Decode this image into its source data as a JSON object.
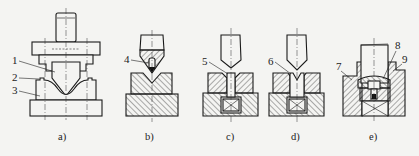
{
  "figure": {
    "line_color": "#1a1a1a",
    "background_color": "#f4f4f2"
  },
  "panels": [
    {
      "id": "a",
      "caption": "a)",
      "description": "Closed bending die set: punch with shank, upper plate, V-die on base plate",
      "callouts": [
        {
          "number": "1",
          "part": "punch"
        },
        {
          "number": "2",
          "part": "die top edge"
        },
        {
          "number": "3",
          "part": "die"
        }
      ]
    },
    {
      "id": "b",
      "caption": "b)",
      "description": "Press-brake punch with insert above hatched V-die on hatched bed",
      "callouts": [
        {
          "number": "4",
          "part": "punch insert"
        }
      ]
    },
    {
      "id": "c",
      "caption": "c)",
      "description": "Punch above split die with vertical slot insert on cushion",
      "callouts": [
        {
          "number": "5",
          "part": "slot insert"
        }
      ]
    },
    {
      "id": "d",
      "caption": "d)",
      "description": "Punch above split die with V-notched insert on cushion",
      "callouts": [
        {
          "number": "6",
          "part": "V-notched insert"
        }
      ]
    },
    {
      "id": "e",
      "caption": "e)",
      "description": "Holder with clamped tool, pin and spring-loaded seat",
      "callouts": [
        {
          "number": "7",
          "part": "holder"
        },
        {
          "number": "8",
          "part": "clamp/seat"
        },
        {
          "number": "9",
          "part": "side wall"
        }
      ]
    }
  ]
}
